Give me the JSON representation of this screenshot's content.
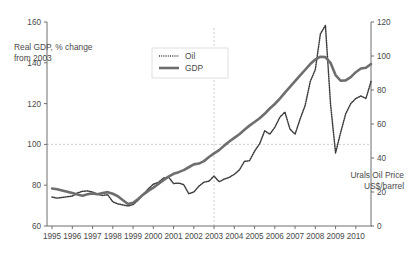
{
  "chart_data": {
    "type": "line",
    "title": "",
    "subtitle": "",
    "xlabel": "",
    "ylabel": "Real GDP, % change from 2003",
    "ylabel_right": "Urals Oil Price US$/barrel",
    "ylabel_right_line1": "Urals Oil Price",
    "ylabel_right_line2": "US$/barrel",
    "ylabel_line1": "Real GDP, % change",
    "ylabel_line2": "from 2003",
    "grid": false,
    "legend_position": "top-center",
    "ylim": [
      60,
      160
    ],
    "ylim_right": [
      0,
      120
    ],
    "xlim": [
      1994.75,
      2010.75
    ],
    "y_ticks": [
      60,
      80,
      100,
      120,
      140,
      160
    ],
    "y_ticks_right": [
      0,
      20,
      40,
      60,
      80,
      100,
      120
    ],
    "x_tick_labels": [
      "1995",
      "1996",
      "1997",
      "1998",
      "1999",
      "2000",
      "2001",
      "2002",
      "2003",
      "2004",
      "2005",
      "2006",
      "2007",
      "2008",
      "2009",
      "2010"
    ],
    "reference_lines": [
      {
        "name": "baseline-100",
        "axis": "y",
        "value": 100,
        "style": "dashed"
      },
      {
        "name": "year-2003",
        "axis": "x",
        "value": 2003,
        "style": "dashed"
      }
    ],
    "series": [
      {
        "name": "Oil",
        "axis": "right",
        "style": "dotted",
        "color": "#3d3d3d",
        "x": [
          1995.0,
          1995.25,
          1995.5,
          1995.75,
          1996.0,
          1996.25,
          1996.5,
          1996.75,
          1997.0,
          1997.25,
          1997.5,
          1997.75,
          1998.0,
          1998.25,
          1998.5,
          1998.75,
          1999.0,
          1999.25,
          1999.5,
          1999.75,
          2000.0,
          2000.25,
          2000.5,
          2000.75,
          2001.0,
          2001.25,
          2001.5,
          2001.75,
          2002.0,
          2002.25,
          2002.5,
          2002.75,
          2003.0,
          2003.25,
          2003.5,
          2003.75,
          2004.0,
          2004.25,
          2004.5,
          2004.75,
          2005.0,
          2005.25,
          2005.5,
          2005.75,
          2006.0,
          2006.25,
          2006.5,
          2006.75,
          2007.0,
          2007.25,
          2007.5,
          2007.75,
          2008.0,
          2008.25,
          2008.5,
          2008.75,
          2009.0,
          2009.25,
          2009.5,
          2009.75,
          2010.0,
          2010.25,
          2010.5,
          2010.75
        ],
        "values": [
          17.0,
          16.4,
          16.8,
          17.2,
          17.6,
          19.4,
          20.4,
          20.6,
          20.0,
          18.6,
          18.0,
          18.4,
          14.2,
          13.0,
          12.4,
          11.8,
          12.6,
          15.2,
          18.6,
          21.8,
          24.6,
          25.6,
          28.2,
          28.8,
          25.0,
          25.2,
          24.4,
          19.0,
          20.0,
          23.4,
          25.8,
          26.4,
          29.4,
          26.0,
          27.6,
          28.6,
          30.4,
          33.0,
          38.0,
          38.4,
          44.0,
          48.4,
          56.0,
          54.0,
          58.0,
          64.0,
          67.0,
          57.0,
          54.0,
          63.0,
          71.0,
          85.0,
          92.0,
          113.0,
          118.0,
          72.0,
          43.0,
          55.0,
          66.0,
          72.0,
          75.0,
          76.5,
          75.0,
          85.0
        ]
      },
      {
        "name": "GDP",
        "axis": "left",
        "style": "solid",
        "color": "#6e6e6e",
        "x": [
          1995.0,
          1995.25,
          1995.5,
          1995.75,
          1996.0,
          1996.25,
          1996.5,
          1996.75,
          1997.0,
          1997.25,
          1997.5,
          1997.75,
          1998.0,
          1998.25,
          1998.5,
          1998.75,
          1999.0,
          1999.25,
          1999.5,
          1999.75,
          2000.0,
          2000.25,
          2000.5,
          2000.75,
          2001.0,
          2001.25,
          2001.5,
          2001.75,
          2002.0,
          2002.25,
          2002.5,
          2002.75,
          2003.0,
          2003.25,
          2003.5,
          2003.75,
          2004.0,
          2004.25,
          2004.5,
          2004.75,
          2005.0,
          2005.25,
          2005.5,
          2005.75,
          2006.0,
          2006.25,
          2006.5,
          2006.75,
          2007.0,
          2007.25,
          2007.5,
          2007.75,
          2008.0,
          2008.25,
          2008.5,
          2008.75,
          2009.0,
          2009.25,
          2009.5,
          2009.75,
          2010.0,
          2010.25,
          2010.5,
          2010.75
        ],
        "values": [
          78.4,
          78.0,
          77.4,
          76.8,
          76.2,
          75.4,
          74.8,
          75.6,
          76.0,
          75.6,
          76.2,
          76.6,
          75.8,
          74.6,
          72.6,
          70.8,
          71.4,
          73.2,
          75.4,
          77.2,
          78.8,
          80.6,
          82.4,
          84.2,
          85.6,
          86.4,
          87.4,
          88.8,
          90.2,
          90.6,
          91.8,
          93.8,
          95.6,
          97.2,
          99.4,
          101.4,
          103.2,
          105.0,
          107.2,
          109.2,
          111.0,
          112.8,
          115.0,
          117.6,
          119.8,
          122.4,
          125.4,
          128.2,
          131.0,
          133.8,
          136.6,
          139.4,
          141.6,
          143.0,
          142.8,
          140.0,
          134.0,
          131.2,
          131.4,
          133.0,
          135.4,
          137.2,
          137.6,
          139.4
        ]
      }
    ]
  },
  "legend": {
    "items": [
      {
        "label": "Oil",
        "style": "dotted"
      },
      {
        "label": "GDP",
        "style": "solid"
      }
    ]
  },
  "caption": {
    "text": ""
  }
}
